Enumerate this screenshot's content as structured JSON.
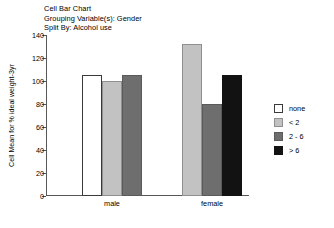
{
  "titles": {
    "line1": "Cell Bar Chart",
    "line2": "Grouping Variable(s): Gender",
    "line3": "Split By: Alcohol use"
  },
  "chart_data": {
    "type": "bar",
    "title": "Cell Bar Chart",
    "subtitle": "Grouping Variable(s): Gender",
    "split_by": "Split By: Alcohol use",
    "xlabel": "",
    "ylabel": "Cell Mean for % ideal weight-3yr",
    "categories": [
      "male",
      "female"
    ],
    "series": [
      {
        "name": "none",
        "color": "#ffffff",
        "values": [
          105,
          null
        ]
      },
      {
        "name": "< 2",
        "color": "#c2c2c2",
        "values": [
          100,
          132
        ]
      },
      {
        "name": "2 - 6",
        "color": "#6e6e6e",
        "values": [
          105,
          80
        ]
      },
      {
        "name": "> 6",
        "color": "#121212",
        "values": [
          null,
          105
        ]
      }
    ],
    "ylim": [
      0,
      140
    ],
    "yticks": [
      0,
      20,
      40,
      60,
      80,
      100,
      120,
      140
    ],
    "ytick_labels": [
      "0",
      "20",
      "40",
      "60",
      "80",
      "100",
      "120",
      "140"
    ],
    "grid": false,
    "legend_position": "right"
  },
  "legend": {
    "entries": [
      {
        "label": "none",
        "color": "#ffffff"
      },
      {
        "label": "< 2",
        "color": "#c2c2c2"
      },
      {
        "label": "2 - 6",
        "color": "#6e6e6e"
      },
      {
        "label": "> 6",
        "color": "#121212"
      }
    ]
  }
}
